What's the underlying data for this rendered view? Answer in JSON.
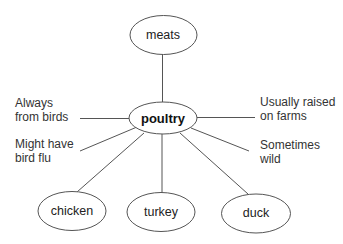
{
  "diagram": {
    "type": "concept-map",
    "central_node": {
      "id": "poultry",
      "label": "poultry",
      "cx": 163,
      "cy": 118,
      "rx": 34,
      "ry": 16
    },
    "parent_node": {
      "id": "meats",
      "label": "meats",
      "cx": 163,
      "cy": 35,
      "rx": 34,
      "ry": 19
    },
    "child_nodes": [
      {
        "id": "chicken",
        "label": "chicken",
        "cx": 72,
        "cy": 211,
        "rx": 34,
        "ry": 19
      },
      {
        "id": "turkey",
        "label": "turkey",
        "cx": 161,
        "cy": 212,
        "rx": 34,
        "ry": 19
      },
      {
        "id": "duck",
        "label": "duck",
        "cx": 256,
        "cy": 213,
        "rx": 34,
        "ry": 19
      }
    ],
    "attributes": [
      {
        "id": "always-from-birds",
        "lines": [
          "Always",
          "from birds"
        ],
        "side": "left"
      },
      {
        "id": "might-have-bird-flu",
        "lines": [
          "Might have",
          "bird flu"
        ],
        "side": "left"
      },
      {
        "id": "usually-raised-on-farms",
        "lines": [
          "Usually raised",
          "on farms"
        ],
        "side": "right"
      },
      {
        "id": "sometimes-wild",
        "lines": [
          "Sometimes",
          "wild"
        ],
        "side": "right"
      }
    ],
    "edges": [
      {
        "from": "meats",
        "to": "poultry"
      },
      {
        "from": "poultry",
        "to": "always-from-birds"
      },
      {
        "from": "poultry",
        "to": "might-have-bird-flu"
      },
      {
        "from": "poultry",
        "to": "usually-raised-on-farms"
      },
      {
        "from": "poultry",
        "to": "sometimes-wild"
      },
      {
        "from": "poultry",
        "to": "chicken"
      },
      {
        "from": "poultry",
        "to": "turkey"
      },
      {
        "from": "poultry",
        "to": "duck"
      }
    ],
    "colors": {
      "stroke": "#555555",
      "text": "#222222",
      "background": "#ffffff"
    }
  }
}
